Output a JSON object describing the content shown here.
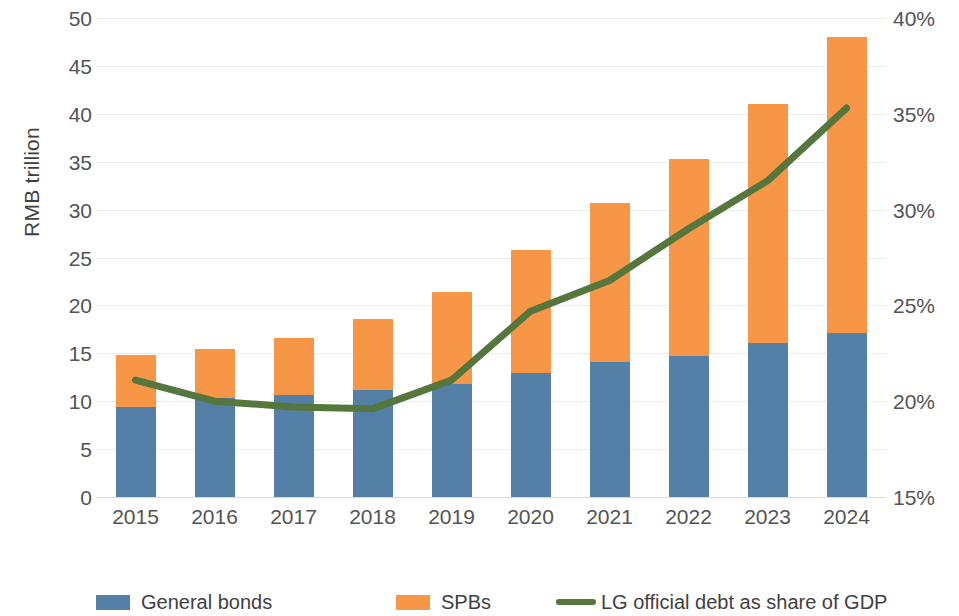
{
  "chart_data": {
    "type": "bar",
    "title": "",
    "subtitle": "",
    "xlabel": "",
    "ylabel": "RMB trillion",
    "y2label": "",
    "categories": [
      "2015",
      "2016",
      "2017",
      "2018",
      "2019",
      "2020",
      "2021",
      "2022",
      "2023",
      "2024"
    ],
    "series": [
      {
        "name": "General bonds",
        "type": "bar",
        "axis": "left",
        "color": "#5480a8",
        "values": [
          9.4,
          10.3,
          10.6,
          11.2,
          11.8,
          12.9,
          14.1,
          14.7,
          16.1,
          17.1
        ]
      },
      {
        "name": "SPBs",
        "type": "bar",
        "axis": "left",
        "color": "#f79646",
        "values": [
          5.4,
          5.1,
          6.0,
          7.4,
          9.6,
          12.9,
          16.6,
          20.6,
          24.9,
          30.9
        ]
      },
      {
        "name": "LG official debt as share of GDP",
        "type": "line",
        "axis": "right",
        "color": "#55763c",
        "values": [
          21.1,
          20.0,
          19.7,
          19.6,
          21.1,
          24.7,
          26.3,
          29.0,
          31.5,
          35.3
        ]
      }
    ],
    "totals": [
      14.8,
      15.4,
      16.6,
      18.6,
      21.4,
      25.8,
      30.7,
      35.3,
      41.0,
      48.0
    ],
    "stacked": true,
    "ylim": [
      0,
      50
    ],
    "yticks": [
      0,
      5,
      10,
      15,
      20,
      25,
      30,
      35,
      40,
      45,
      50
    ],
    "ytick_labels": [
      "0",
      "5",
      "10",
      "15",
      "20",
      "25",
      "30",
      "35",
      "40",
      "45",
      "50"
    ],
    "y2lim": [
      15,
      40
    ],
    "y2ticks": [
      15,
      20,
      25,
      30,
      35,
      40
    ],
    "y2tick_labels": [
      "15%",
      "20%",
      "25%",
      "30%",
      "35%",
      "40%"
    ],
    "grid": true,
    "legend_position": "bottom"
  },
  "legend": {
    "items": [
      {
        "label": "General bonds",
        "marker": "square",
        "color": "#5480a8"
      },
      {
        "label": "SPBs",
        "marker": "square",
        "color": "#f79646"
      },
      {
        "label": "LG official debt as share of GDP",
        "marker": "line",
        "color": "#55763c"
      }
    ]
  },
  "colors": {
    "general_bonds": "#5480a8",
    "spbs": "#f79646",
    "line": "#55763c",
    "gridline": "#ededed",
    "text": "#545454",
    "background": "#ffffff"
  }
}
